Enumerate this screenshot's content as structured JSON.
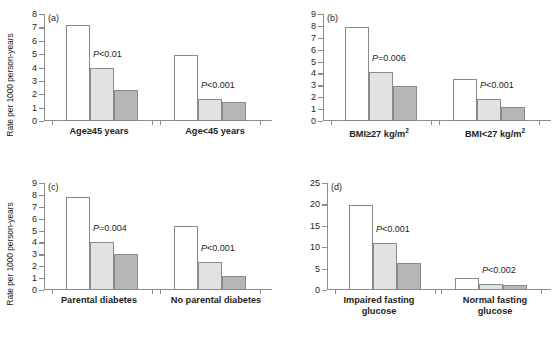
{
  "figure": {
    "y_axis_label": "Rate per 1000 person-years",
    "colors": {
      "bar_white": "#ffffff",
      "bar_light": "#e2e2e2",
      "bar_dark": "#b6b6b6",
      "axis": "#8c8c8c",
      "text": "#231f20",
      "background": "#ffffff"
    }
  },
  "chart_data": [
    {
      "type": "bar",
      "panel": "(a)",
      "title": "",
      "xlabel": "",
      "ylabel": "Rate per 1000 person-years",
      "ylim": [
        0,
        8
      ],
      "yticks": [
        0,
        1,
        2,
        3,
        4,
        5,
        6,
        7,
        8
      ],
      "grid": false,
      "legend": "none",
      "categories": [
        "Age≥45 years",
        "Age<45 years"
      ],
      "series": [
        {
          "name": "white",
          "values": [
            7.15,
            4.95
          ]
        },
        {
          "name": "light-gray",
          "values": [
            4.0,
            1.65
          ]
        },
        {
          "name": "dark-gray",
          "values": [
            2.35,
            1.45
          ]
        }
      ],
      "annotations": [
        {
          "text": "P<0.01",
          "group": 0
        },
        {
          "text": "P<0.001",
          "group": 1
        }
      ]
    },
    {
      "type": "bar",
      "panel": "(b)",
      "title": "",
      "xlabel": "",
      "ylabel": "",
      "ylim": [
        0,
        9
      ],
      "yticks": [
        0,
        1,
        2,
        3,
        4,
        5,
        6,
        7,
        8,
        9
      ],
      "grid": false,
      "legend": "none",
      "categories": [
        "BMI≥27 kg/m2",
        "BMI<27 kg/m2"
      ],
      "series": [
        {
          "name": "white",
          "values": [
            7.9,
            3.5
          ]
        },
        {
          "name": "light-gray",
          "values": [
            4.1,
            1.85
          ]
        },
        {
          "name": "dark-gray",
          "values": [
            2.95,
            1.15
          ]
        }
      ],
      "annotations": [
        {
          "text": "P=0.006",
          "group": 0
        },
        {
          "text": "P<0.001",
          "group": 1
        }
      ]
    },
    {
      "type": "bar",
      "panel": "(c)",
      "title": "",
      "xlabel": "",
      "ylabel": "Rate per 1000 person-years",
      "ylim": [
        0,
        9
      ],
      "yticks": [
        0,
        1,
        2,
        3,
        4,
        5,
        6,
        7,
        8,
        9
      ],
      "grid": false,
      "legend": "none",
      "categories": [
        "Parental diabetes",
        "No parental diabetes"
      ],
      "series": [
        {
          "name": "white",
          "values": [
            7.8,
            5.4
          ]
        },
        {
          "name": "light-gray",
          "values": [
            4.05,
            2.35
          ]
        },
        {
          "name": "dark-gray",
          "values": [
            3.0,
            1.15
          ]
        }
      ],
      "annotations": [
        {
          "text": "P=0.004",
          "group": 0
        },
        {
          "text": "P<0.001",
          "group": 1
        }
      ]
    },
    {
      "type": "bar",
      "panel": "(d)",
      "title": "",
      "xlabel": "",
      "ylabel": "",
      "ylim": [
        0,
        25
      ],
      "yticks": [
        0,
        5,
        10,
        15,
        20,
        25
      ],
      "grid": false,
      "legend": "none",
      "categories": [
        "Impaired fasting\nglucose",
        "Normal fasting\nglucose"
      ],
      "series": [
        {
          "name": "white",
          "values": [
            19.8,
            2.8
          ]
        },
        {
          "name": "light-gray",
          "values": [
            11.0,
            1.3
          ]
        },
        {
          "name": "dark-gray",
          "values": [
            6.4,
            1.1
          ]
        }
      ],
      "annotations": [
        {
          "text": "P<0.001",
          "group": 0
        },
        {
          "text": "P<0.002",
          "group": 1
        }
      ]
    }
  ],
  "panels": {
    "a": {
      "tag": "(a)",
      "ylabel": "Rate per 1000 person-years",
      "cat1": "Age≥45 years",
      "cat2": "Age<45 years",
      "p1_prefix": "P",
      "p1_rest": "<0.01",
      "p2_prefix": "P",
      "p2_rest": "<0.001"
    },
    "b": {
      "tag": "(b)",
      "cat1_main": "BMI≥27 kg/m",
      "cat1_sup": "2",
      "cat2_main": "BMI<27 kg/m",
      "cat2_sup": "2",
      "p1_prefix": "P",
      "p1_rest": "=0.006",
      "p2_prefix": "P",
      "p2_rest": "<0.001"
    },
    "c": {
      "tag": "(c)",
      "ylabel": "Rate per 1000 person-years",
      "cat1": "Parental diabetes",
      "cat2": "No parental diabetes",
      "p1_prefix": "P",
      "p1_rest": "=0.004",
      "p2_prefix": "P",
      "p2_rest": "<0.001"
    },
    "d": {
      "tag": "(d)",
      "cat1": "Impaired fasting\nglucose",
      "cat2": "Normal fasting\nglucose",
      "p1_prefix": "P",
      "p1_rest": "<0.001",
      "p2_prefix": "P",
      "p2_rest": "<0.002"
    }
  }
}
